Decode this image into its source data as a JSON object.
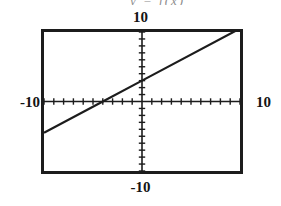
{
  "header": {
    "clipped_text": "y = f(x)"
  },
  "window_labels": {
    "ymax": "10",
    "ymin": "-10",
    "xmin": "-10",
    "xmax": "10"
  },
  "colors": {
    "frame": "#1c1c1c",
    "axis": "#1c1c1c",
    "curve": "#1c1c1c",
    "background": "#ffffff",
    "label_text": "#141414"
  },
  "chart_data": {
    "type": "line",
    "title": "",
    "subtitle": "",
    "xlabel": "",
    "ylabel": "",
    "xlim": [
      -10,
      10
    ],
    "ylim": [
      -10,
      10
    ],
    "grid": false,
    "legend": null,
    "axes": {
      "x_axis_y_value": 0,
      "y_axis_x_value": 0,
      "x_tick_interval": 1,
      "y_tick_interval": 1,
      "x_tick_values": [
        -10,
        -9,
        -8,
        -7,
        -6,
        -5,
        -4,
        -3,
        -2,
        -1,
        1,
        2,
        3,
        4,
        5,
        6,
        7,
        8,
        9,
        10
      ],
      "y_tick_values": [
        -10,
        -9,
        -8,
        -7,
        -6,
        -5,
        -4,
        -3,
        -2,
        -1,
        1,
        2,
        3,
        4,
        5,
        6,
        7,
        8,
        9,
        10
      ],
      "tick_style": "short-marks-on-axis"
    },
    "series": [
      {
        "name": "f(x)",
        "kind": "straight-line",
        "x_intercept": -4,
        "y_intercept": 3,
        "slope": 0.75,
        "x": [
          -10,
          -4,
          0,
          9.6
        ],
        "values": [
          -4.5,
          0,
          3,
          10.2
        ],
        "drawn_x_range": [
          -10,
          9.6
        ],
        "drawn_y_range": [
          -4.5,
          7.2
        ]
      }
    ],
    "annotations": [
      {
        "text": "10",
        "position": "top-outside-center"
      },
      {
        "text": "-10",
        "position": "bottom-outside-center"
      },
      {
        "text": "-10",
        "position": "left-outside-middle"
      },
      {
        "text": "10",
        "position": "right-outside-middle"
      }
    ]
  }
}
